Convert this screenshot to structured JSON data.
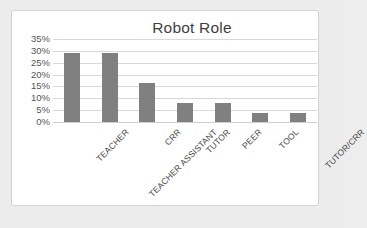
{
  "chart_data": {
    "type": "bar",
    "title": "Robot Role",
    "xlabel": "",
    "ylabel": "",
    "categories": [
      "TEACHER",
      "TEACHER ASSISTANT",
      "CRR",
      "TUTOR",
      "PEER",
      "TOOL",
      "TUTOR/CRR"
    ],
    "values": [
      29,
      29,
      16.5,
      8,
      8,
      4,
      3.8
    ],
    "value_labels": [
      "29%",
      "29%",
      "16.5%",
      "8%",
      "8%",
      "4%",
      "3.8%"
    ],
    "ylim": [
      0,
      35
    ],
    "ytick_values": [
      0,
      5,
      10,
      15,
      20,
      25,
      30,
      35
    ],
    "ytick_labels": [
      "0%",
      "5%",
      "10%",
      "15%",
      "20%",
      "25%",
      "30%",
      "35%"
    ],
    "grid": true,
    "legend": false,
    "legend_position": "none",
    "orientation": "vertical",
    "bar_color": "#808080",
    "gridline_color": "#d9d9d9",
    "axis_text_color": "#555555",
    "title_color": "#3f3f3f",
    "plot_background": "#ffffff",
    "figure_background": "#ececec",
    "border_color": "#d2d2d2",
    "xtick_rotation": -45
  }
}
